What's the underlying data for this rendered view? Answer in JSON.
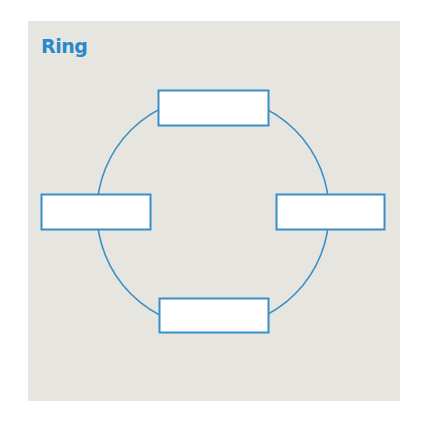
{
  "diagram": {
    "title": "Ring",
    "type": "network-topology",
    "colors": {
      "accent": "#2a88cc",
      "stroke": "#3a8ec8",
      "panel_bg": "#e7e5df",
      "node_fill": "#ffffff"
    },
    "ring": {
      "cx": 213,
      "cy": 212,
      "r": 116
    },
    "nodes": [
      {
        "id": "top",
        "x": 158,
        "y": 90,
        "w": 110,
        "h": 35,
        "label": ""
      },
      {
        "id": "left",
        "x": 41,
        "y": 194,
        "w": 109,
        "h": 35,
        "label": ""
      },
      {
        "id": "right",
        "x": 276,
        "y": 194,
        "w": 108,
        "h": 35,
        "label": ""
      },
      {
        "id": "bottom",
        "x": 159,
        "y": 298,
        "w": 109,
        "h": 34,
        "label": ""
      }
    ]
  }
}
